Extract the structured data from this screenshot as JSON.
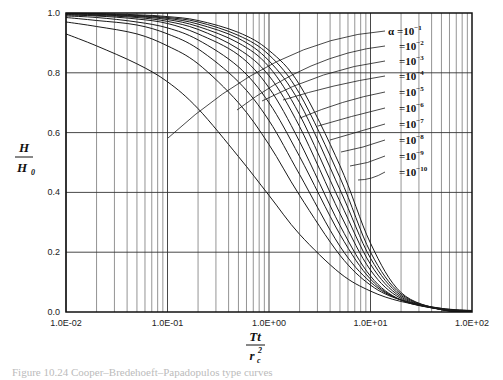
{
  "chart_data": {
    "type": "line",
    "title": "",
    "xlabel": "Tt / r_c^2",
    "ylabel": "H / H_0",
    "x_scale": "log",
    "xlim": [
      0.01,
      100
    ],
    "ylim": [
      0.0,
      1.0
    ],
    "grid": true,
    "x_ticks": [
      "1.0E-02",
      "1.0E-01",
      "1.0E+00",
      "1.0E+01",
      "1.0E+02"
    ],
    "y_ticks": [
      "0.0",
      "0.2",
      "0.4",
      "0.6",
      "0.8",
      "1.0"
    ],
    "legend_position": "inline-right",
    "series": [
      {
        "name": "α=10^-1",
        "x": [
          0.01,
          0.02,
          0.05,
          0.1,
          0.2,
          0.5,
          1,
          2,
          5,
          10,
          20,
          50,
          100
        ],
        "y": [
          0.93,
          0.89,
          0.83,
          0.77,
          0.68,
          0.52,
          0.39,
          0.26,
          0.13,
          0.07,
          0.035,
          0.012,
          0.005
        ]
      },
      {
        "name": "10^-2",
        "x": [
          0.01,
          0.02,
          0.05,
          0.1,
          0.2,
          0.5,
          1,
          2,
          5,
          10,
          20,
          50,
          100
        ],
        "y": [
          0.97,
          0.955,
          0.93,
          0.89,
          0.83,
          0.7,
          0.56,
          0.39,
          0.19,
          0.09,
          0.04,
          0.012,
          0.004
        ]
      },
      {
        "name": "10^-3",
        "x": [
          0.01,
          0.02,
          0.05,
          0.1,
          0.2,
          0.5,
          1,
          2,
          5,
          10,
          20,
          50,
          100
        ],
        "y": [
          0.985,
          0.975,
          0.96,
          0.93,
          0.88,
          0.77,
          0.64,
          0.46,
          0.22,
          0.1,
          0.04,
          0.01,
          0.003
        ]
      },
      {
        "name": "10^-4",
        "x": [
          0.01,
          0.02,
          0.05,
          0.1,
          0.2,
          0.5,
          1,
          2,
          5,
          10,
          20,
          50,
          100
        ],
        "y": [
          0.99,
          0.985,
          0.97,
          0.95,
          0.91,
          0.82,
          0.7,
          0.52,
          0.26,
          0.11,
          0.04,
          0.01,
          0.003
        ]
      },
      {
        "name": "10^-5",
        "x": [
          0.01,
          0.02,
          0.05,
          0.1,
          0.2,
          0.5,
          1,
          2,
          5,
          10,
          20,
          50,
          100
        ],
        "y": [
          0.993,
          0.99,
          0.98,
          0.965,
          0.93,
          0.86,
          0.75,
          0.57,
          0.29,
          0.12,
          0.04,
          0.009,
          0.002
        ]
      },
      {
        "name": "10^-6",
        "x": [
          0.01,
          0.02,
          0.05,
          0.1,
          0.2,
          0.5,
          1,
          2,
          5,
          10,
          20,
          50,
          100
        ],
        "y": [
          0.995,
          0.992,
          0.985,
          0.972,
          0.945,
          0.88,
          0.79,
          0.62,
          0.33,
          0.14,
          0.045,
          0.008,
          0.002
        ]
      },
      {
        "name": "10^-7",
        "x": [
          0.01,
          0.02,
          0.05,
          0.1,
          0.2,
          0.5,
          1,
          2,
          5,
          10,
          20,
          50,
          100
        ],
        "y": [
          0.997,
          0.994,
          0.988,
          0.978,
          0.955,
          0.9,
          0.82,
          0.66,
          0.37,
          0.16,
          0.05,
          0.008,
          0.002
        ]
      },
      {
        "name": "10^-8",
        "x": [
          0.01,
          0.02,
          0.05,
          0.1,
          0.2,
          0.5,
          1,
          2,
          5,
          10,
          20,
          50,
          100
        ],
        "y": [
          0.998,
          0.996,
          0.99,
          0.982,
          0.963,
          0.915,
          0.84,
          0.7,
          0.41,
          0.18,
          0.055,
          0.008,
          0.002
        ]
      },
      {
        "name": "10^-9",
        "x": [
          0.01,
          0.02,
          0.05,
          0.1,
          0.2,
          0.5,
          1,
          2,
          5,
          10,
          20,
          50,
          100
        ],
        "y": [
          0.998,
          0.997,
          0.992,
          0.985,
          0.97,
          0.925,
          0.86,
          0.73,
          0.45,
          0.2,
          0.06,
          0.008,
          0.002
        ]
      },
      {
        "name": "10^-10",
        "x": [
          0.01,
          0.02,
          0.05,
          0.1,
          0.2,
          0.5,
          1,
          2,
          5,
          10,
          20,
          50,
          100
        ],
        "y": [
          0.999,
          0.998,
          0.994,
          0.988,
          0.975,
          0.935,
          0.875,
          0.76,
          0.49,
          0.23,
          0.065,
          0.008,
          0.002
        ]
      }
    ]
  },
  "labels": {
    "alpha_prefix": "α =",
    "eq": "=",
    "base": "10",
    "exponents": [
      "−1",
      "−2",
      "−3",
      "−4",
      "−5",
      "−6",
      "−7",
      "−8",
      "−9",
      "−10"
    ],
    "xlabel_num": "Tt",
    "xlabel_den": "r",
    "xlabel_den_sub": "c",
    "xlabel_den_sup": "2",
    "ylabel_num": "H",
    "ylabel_den": "H",
    "ylabel_den_sub": "0"
  },
  "caption": "Figure 10.24 Cooper–Bredehoeft–Papadopulos type curves"
}
